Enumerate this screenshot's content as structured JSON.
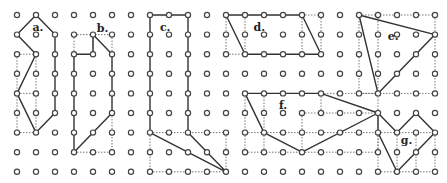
{
  "diagram": {
    "grid": {
      "cols": 23,
      "rows": 9,
      "origin_x": 17,
      "origin_y": 15,
      "dx": 19.0,
      "dy": 19.6,
      "dot_radius": 2.6
    },
    "colors": {
      "line": "#333333",
      "dotted": "#777777",
      "dot": "#444444",
      "background": "#ffffff"
    },
    "figures": [
      {
        "label": "a.",
        "label_pos": [
          1.1,
          0.6
        ],
        "polygon": [
          [
            1,
            0
          ],
          [
            0,
            1
          ],
          [
            1,
            2
          ],
          [
            0,
            4
          ],
          [
            1,
            6
          ],
          [
            2,
            5
          ],
          [
            2,
            1
          ]
        ],
        "dotted": [
          [
            [
              0,
              2
            ],
            [
              1,
              2
            ]
          ],
          [
            [
              0,
              2
            ],
            [
              0,
              6
            ]
          ],
          [
            [
              1,
              2
            ],
            [
              1,
              6
            ]
          ],
          [
            [
              0,
              4
            ],
            [
              1,
              4
            ]
          ],
          [
            [
              0,
              6
            ],
            [
              1,
              6
            ]
          ]
        ]
      },
      {
        "label": "b.",
        "label_pos": [
          4.5,
          0.65
        ],
        "polygon": [
          [
            3,
            2
          ],
          [
            4,
            2
          ],
          [
            4,
            1
          ],
          [
            5,
            2
          ],
          [
            5,
            5
          ],
          [
            3,
            7
          ]
        ],
        "dotted": [
          [
            [
              3,
              1
            ],
            [
              5,
              1
            ]
          ],
          [
            [
              3,
              1
            ],
            [
              3,
              2
            ]
          ],
          [
            [
              5,
              1
            ],
            [
              5,
              2
            ]
          ],
          [
            [
              3,
              7
            ],
            [
              5,
              7
            ]
          ],
          [
            [
              5,
              5
            ],
            [
              5,
              7
            ]
          ],
          [
            [
              4,
              2
            ],
            [
              4,
              1
            ]
          ]
        ]
      },
      {
        "label": "c.",
        "label_pos": [
          7.8,
          0.6
        ],
        "polygon": [
          [
            7,
            0
          ],
          [
            9,
            0
          ],
          [
            9,
            6
          ],
          [
            11,
            8
          ],
          [
            7,
            6
          ]
        ],
        "dotted": [
          [
            [
              7,
              6
            ],
            [
              11,
              6
            ]
          ],
          [
            [
              7,
              6
            ],
            [
              7,
              8
            ]
          ],
          [
            [
              7,
              8
            ],
            [
              11,
              8
            ]
          ],
          [
            [
              11,
              6
            ],
            [
              11,
              8
            ]
          ]
        ]
      },
      {
        "label": "d.",
        "label_pos": [
          12.75,
          0.6
        ],
        "polygon": [
          [
            11,
            0
          ],
          [
            15,
            0
          ],
          [
            16,
            2
          ],
          [
            12,
            2
          ]
        ],
        "dotted": [
          [
            [
              15,
              0
            ],
            [
              16,
              0
            ]
          ],
          [
            [
              11,
              2
            ],
            [
              12,
              2
            ]
          ],
          [
            [
              11,
              0
            ],
            [
              11,
              2
            ]
          ],
          [
            [
              12,
              0
            ],
            [
              12,
              2
            ]
          ],
          [
            [
              15,
              0
            ],
            [
              15,
              2
            ]
          ],
          [
            [
              16,
              0
            ],
            [
              16,
              2
            ]
          ]
        ]
      },
      {
        "label": "e.",
        "label_pos": [
          19.8,
          1.05
        ],
        "polygon": [
          [
            18,
            0
          ],
          [
            22,
            1
          ],
          [
            19,
            4
          ]
        ],
        "dotted": [
          [
            [
              18,
              0
            ],
            [
              22,
              0
            ]
          ],
          [
            [
              18,
              0
            ],
            [
              18,
              4
            ]
          ],
          [
            [
              19,
              0
            ],
            [
              19,
              4
            ]
          ],
          [
            [
              22,
              0
            ],
            [
              22,
              4
            ]
          ],
          [
            [
              18,
              4
            ],
            [
              22,
              4
            ]
          ]
        ]
      },
      {
        "label": "f.",
        "label_pos": [
          14.0,
          4.6
        ],
        "polygon": [
          [
            12,
            4
          ],
          [
            16,
            4
          ],
          [
            19,
            5
          ],
          [
            15,
            7
          ],
          [
            13,
            6
          ]
        ],
        "dotted": [
          [
            [
              16,
              4
            ],
            [
              19,
              4
            ]
          ],
          [
            [
              12,
              4
            ],
            [
              12,
              7
            ]
          ],
          [
            [
              13,
              4
            ],
            [
              13,
              7
            ]
          ],
          [
            [
              19,
              4
            ],
            [
              19,
              7
            ]
          ],
          [
            [
              12,
              7
            ],
            [
              19,
              7
            ]
          ],
          [
            [
              12,
              6
            ],
            [
              13,
              6
            ]
          ],
          [
            [
              15,
              5
            ],
            [
              19,
              5
            ]
          ],
          [
            [
              15,
              5
            ],
            [
              15,
              7
            ]
          ],
          [
            [
              16,
              4
            ],
            [
              16,
              5
            ]
          ],
          [
            [
              13,
              6
            ],
            [
              19,
              6
            ]
          ]
        ]
      },
      {
        "label": "g.",
        "label_pos": [
          20.5,
          6.4
        ],
        "polygon": [
          [
            19,
            5
          ],
          [
            20,
            6
          ],
          [
            21,
            5
          ],
          [
            22,
            6
          ],
          [
            20,
            8
          ],
          [
            19,
            6
          ]
        ],
        "dotted": [
          [
            [
              19,
              6
            ],
            [
              22,
              6
            ]
          ],
          [
            [
              19,
              6
            ],
            [
              19,
              8
            ]
          ],
          [
            [
              22,
              6
            ],
            [
              22,
              8
            ]
          ],
          [
            [
              19,
              8
            ],
            [
              22,
              8
            ]
          ],
          [
            [
              20,
              6
            ],
            [
              20,
              8
            ]
          ],
          [
            [
              21,
              6
            ],
            [
              21,
              8
            ]
          ]
        ]
      }
    ]
  }
}
